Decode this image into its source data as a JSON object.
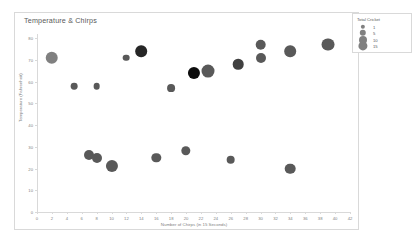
{
  "chart_data": {
    "type": "scatter",
    "title": "Temperature & Chirps",
    "xlabel": "Number of Chirps (in 15 Seconds)",
    "ylabel": "Temperature (Fahrenheit)",
    "xlim": [
      0,
      42
    ],
    "ylim": [
      0,
      80
    ],
    "xticks": [
      0,
      2,
      4,
      6,
      8,
      10,
      12,
      14,
      16,
      18,
      20,
      22,
      24,
      26,
      28,
      30,
      32,
      34,
      36,
      38,
      40,
      42
    ],
    "yticks": [
      0,
      10,
      20,
      30,
      40,
      50,
      60,
      70,
      80
    ],
    "grid": false,
    "legend": {
      "title": "Total Cricket",
      "position": "top-right",
      "entries": [
        {
          "label": "1",
          "size": 1
        },
        {
          "label": "5",
          "size": 5
        },
        {
          "label": "10",
          "size": 10
        },
        {
          "label": "15",
          "size": 15
        }
      ]
    },
    "series_name": "Total Cricket",
    "points": [
      {
        "x": 2,
        "y": 71,
        "size": 10,
        "color": "#808080"
      },
      {
        "x": 5,
        "y": 58,
        "size": 1,
        "color": "#595959"
      },
      {
        "x": 7,
        "y": 26,
        "size": 5,
        "color": "#595959"
      },
      {
        "x": 8,
        "y": 58,
        "size": 1,
        "color": "#595959"
      },
      {
        "x": 8,
        "y": 25,
        "size": 5,
        "color": "#595959"
      },
      {
        "x": 10,
        "y": 21,
        "size": 9,
        "color": "#595959"
      },
      {
        "x": 12,
        "y": 71,
        "size": 1,
        "color": "#595959"
      },
      {
        "x": 14,
        "y": 74,
        "size": 8,
        "color": "#262626"
      },
      {
        "x": 16,
        "y": 25,
        "size": 4,
        "color": "#595959"
      },
      {
        "x": 18,
        "y": 57,
        "size": 2,
        "color": "#595959"
      },
      {
        "x": 20,
        "y": 28,
        "size": 4,
        "color": "#595959"
      },
      {
        "x": 21,
        "y": 64,
        "size": 9,
        "color": "#0d0d0d"
      },
      {
        "x": 23,
        "y": 65,
        "size": 11,
        "color": "#595959"
      },
      {
        "x": 26,
        "y": 24,
        "size": 3,
        "color": "#595959"
      },
      {
        "x": 27,
        "y": 68,
        "size": 6,
        "color": "#404040"
      },
      {
        "x": 30,
        "y": 77,
        "size": 6,
        "color": "#595959"
      },
      {
        "x": 30,
        "y": 71,
        "size": 5,
        "color": "#595959"
      },
      {
        "x": 34,
        "y": 74,
        "size": 8,
        "color": "#595959"
      },
      {
        "x": 34,
        "y": 20,
        "size": 6,
        "color": "#595959"
      },
      {
        "x": 39,
        "y": 77,
        "size": 11,
        "color": "#595959"
      }
    ]
  }
}
